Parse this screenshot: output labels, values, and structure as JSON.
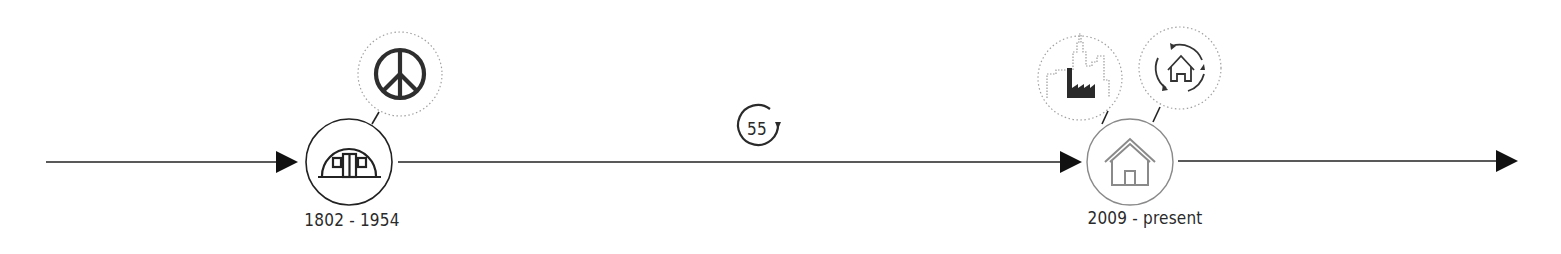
{
  "timeline": {
    "colors": {
      "line": "#222222",
      "node_dark": "#2a2a2a",
      "node_light": "#8a8a8a",
      "dotted": "#9a9a9a",
      "background": "#ffffff"
    },
    "milestones": [
      {
        "id": "quonset-hut",
        "label": "1802 - 1954",
        "icon": "quonset-hut-icon",
        "related": [
          {
            "icon": "peace-sign-icon"
          }
        ]
      },
      {
        "id": "home",
        "label": "2009 - present",
        "icon": "house-icon",
        "related": [
          {
            "icon": "city-factory-icon"
          },
          {
            "icon": "house-cycle-icon"
          }
        ]
      }
    ],
    "interval": {
      "value": "55",
      "icon": "cycle-arrow-icon"
    }
  }
}
